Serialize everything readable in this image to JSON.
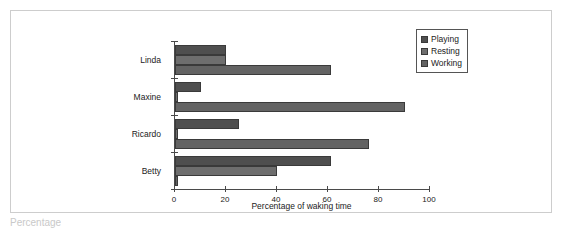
{
  "chart_data": {
    "type": "bar",
    "orientation": "horizontal",
    "title": "",
    "xlabel": "Percentage of waking time",
    "ylabel": "",
    "xlim": [
      0,
      100
    ],
    "xticks": [
      0,
      20,
      40,
      60,
      80,
      100
    ],
    "xtick_labels": [
      "0",
      "20",
      "40",
      "60",
      "80",
      "100"
    ],
    "grid": false,
    "legend_position": "top-right",
    "categories": [
      "Linda",
      "Maxine",
      "Ricardo",
      "Betty"
    ],
    "series": [
      {
        "name": "Playing",
        "color": "#4f4f4f",
        "values": [
          20,
          10,
          25,
          61
        ]
      },
      {
        "name": "Resting",
        "color": "#6e6e6e",
        "values": [
          20,
          1,
          1,
          40
        ]
      },
      {
        "name": "Working",
        "color": "#636363",
        "values": [
          61,
          90,
          76,
          1
        ]
      }
    ]
  },
  "legend": {
    "entries": [
      "Playing",
      "Resting",
      "Working"
    ]
  },
  "caption": {
    "text": "Percentage"
  },
  "colors": {
    "axis": "#4a4a4a",
    "frame": "#cdcdcd",
    "text": "#222222"
  }
}
